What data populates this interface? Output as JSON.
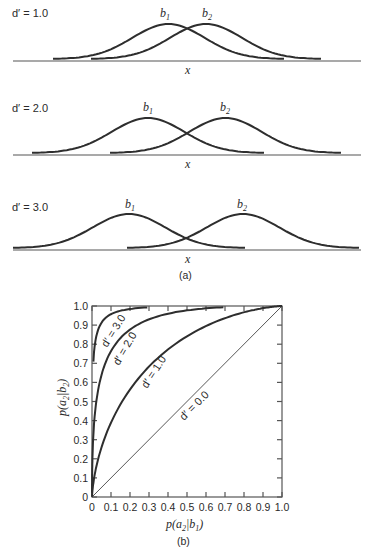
{
  "panel_a": {
    "caption": "(a)",
    "x_label": "x",
    "rows": [
      {
        "dprime_label": "d′ = 1.0",
        "b1_label": "b",
        "b1_sub": "1",
        "b2_label": "b",
        "b2_sub": "2"
      },
      {
        "dprime_label": "d′ = 2.0",
        "b1_label": "b",
        "b1_sub": "1",
        "b2_label": "b",
        "b2_sub": "2"
      },
      {
        "dprime_label": "d′ = 3.0",
        "b1_label": "b",
        "b1_sub": "1",
        "b2_label": "b",
        "b2_sub": "2"
      }
    ]
  },
  "panel_b": {
    "caption": "(b)",
    "xlabel_main": "p(a",
    "xlabel_sub1": "2",
    "xlabel_mid": "|b",
    "xlabel_sub2": "1",
    "xlabel_end": ")",
    "ylabel_main": "p(a",
    "ylabel_sub1": "2",
    "ylabel_mid": "|b",
    "ylabel_sub2": "2",
    "ylabel_end": ")",
    "x_ticks": [
      "0",
      "0.1",
      "0.2",
      "0.3",
      "0.4",
      "0.5",
      "0.6",
      "0.7",
      "0.8",
      "0.9",
      "1.0"
    ],
    "y_ticks": [
      "0",
      "0.1",
      "0.2",
      "0.3",
      "0.4",
      "0.5",
      "0.6",
      "0.7",
      "0.8",
      "0.9",
      "1.0"
    ],
    "curve_labels": [
      "d′ = 3.0",
      "d′ = 2.0",
      "d′ = 1.0",
      "d′ = 0.0"
    ]
  },
  "chart_data": [
    {
      "type": "line",
      "title": "(a) Overlapping distributions of b1 and b2 along x for different d′",
      "xlabel": "x",
      "ylabel": "",
      "panels": [
        {
          "dprime": 1.0,
          "series": [
            {
              "name": "b1",
              "mean": 0.0,
              "sd": 1.0
            },
            {
              "name": "b2",
              "mean": 1.0,
              "sd": 1.0
            }
          ]
        },
        {
          "dprime": 2.0,
          "series": [
            {
              "name": "b1",
              "mean": 0.0,
              "sd": 1.0
            },
            {
              "name": "b2",
              "mean": 2.0,
              "sd": 1.0
            }
          ]
        },
        {
          "dprime": 3.0,
          "series": [
            {
              "name": "b1",
              "mean": 0.0,
              "sd": 1.0
            },
            {
              "name": "b2",
              "mean": 3.0,
              "sd": 1.0
            }
          ]
        }
      ],
      "grid": false
    },
    {
      "type": "line",
      "title": "(b) ROC curves",
      "xlabel": "p(a2|b1)",
      "ylabel": "p(a2|b2)",
      "xlim": [
        0,
        1.0
      ],
      "ylim": [
        0,
        1.0
      ],
      "x_ticks": [
        0,
        0.1,
        0.2,
        0.3,
        0.4,
        0.5,
        0.6,
        0.7,
        0.8,
        0.9,
        1.0
      ],
      "y_ticks": [
        0,
        0.1,
        0.2,
        0.3,
        0.4,
        0.5,
        0.6,
        0.7,
        0.8,
        0.9,
        1.0
      ],
      "grid": false,
      "legend": "inline curve labels",
      "series": [
        {
          "name": "d′ = 0.0",
          "x": [
            0,
            0.2,
            0.4,
            0.6,
            0.8,
            1.0
          ],
          "y": [
            0,
            0.2,
            0.4,
            0.6,
            0.8,
            1.0
          ]
        },
        {
          "name": "d′ = 1.0",
          "x": [
            0,
            0.02,
            0.05,
            0.1,
            0.2,
            0.3,
            0.4,
            0.5,
            0.6,
            0.7,
            0.8,
            0.9,
            1.0
          ],
          "y": [
            0,
            0.1,
            0.2,
            0.3,
            0.46,
            0.57,
            0.66,
            0.74,
            0.81,
            0.87,
            0.92,
            0.96,
            1.0
          ]
        },
        {
          "name": "d′ = 2.0",
          "x": [
            0,
            0.01,
            0.02,
            0.05,
            0.1,
            0.2,
            0.3,
            0.4,
            0.5,
            0.6,
            0.7,
            0.8,
            0.9,
            1.0
          ],
          "y": [
            0,
            0.27,
            0.4,
            0.56,
            0.7,
            0.83,
            0.9,
            0.94,
            0.96,
            0.98,
            0.99,
            1.0,
            1.0,
            1.0
          ]
        },
        {
          "name": "d′ = 3.0",
          "x": [
            0,
            0.005,
            0.01,
            0.02,
            0.05,
            0.1,
            0.2,
            0.3
          ],
          "y": [
            0.7,
            0.75,
            0.8,
            0.86,
            0.92,
            0.96,
            0.99,
            1.0
          ]
        }
      ]
    }
  ]
}
